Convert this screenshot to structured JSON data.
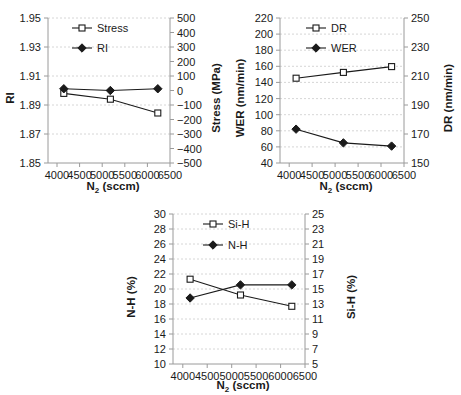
{
  "figure": {
    "background": "#ffffff",
    "line_color": "#1a1a1a",
    "grid_color": "#cccccc",
    "axis_color": "#9a9a9a"
  },
  "chart_data": [
    {
      "id": "panel-a",
      "type": "line",
      "title": "",
      "xlabel": "N2 (sccm)",
      "xlabel_base": "N",
      "xlabel_sub": "2",
      "xlabel_unit": " (sccm)",
      "ylabel": "RI",
      "y2label": "Stress (MPa)",
      "x": [
        4150,
        5180,
        6230
      ],
      "xlim": [
        3800,
        6500
      ],
      "xticks": [
        4000,
        4500,
        5000,
        5500,
        6000,
        6500
      ],
      "ylim": [
        1.85,
        1.95
      ],
      "yticks": [
        1.85,
        1.87,
        1.89,
        1.91,
        1.93,
        1.95
      ],
      "ytick_labels": [
        "1.85",
        "1.87",
        "1.89",
        "1.91",
        "1.93",
        "1.95"
      ],
      "y2lim": [
        -500,
        500
      ],
      "y2ticks": [
        -500,
        -400,
        -300,
        -200,
        -100,
        0,
        100,
        200,
        300,
        400,
        500
      ],
      "y2tick_labels": [
        "−500",
        "−400",
        "−300",
        "−200",
        "−100",
        "0",
        "100",
        "200",
        "300",
        "400",
        "500"
      ],
      "grid": true,
      "legend_position": "top-center",
      "series": [
        {
          "name": "Stress",
          "axis": "right",
          "marker": "open-square",
          "values": [
            -20,
            -60,
            -155
          ],
          "unit": "MPa"
        },
        {
          "name": "RI",
          "axis": "left",
          "marker": "filled-diamond",
          "values": [
            1.9012,
            1.9,
            1.9012
          ],
          "unit": ""
        }
      ]
    },
    {
      "id": "panel-b",
      "type": "line",
      "title": "",
      "xlabel": "N2 (sccm)",
      "xlabel_base": "N",
      "xlabel_sub": "2",
      "xlabel_unit": " (sccm)",
      "ylabel": "WER (nm/min)",
      "y2label": "DR (nm/min)",
      "x": [
        4150,
        5180,
        6230
      ],
      "xlim": [
        3800,
        6500
      ],
      "xticks": [
        4000,
        4500,
        5000,
        5500,
        6000,
        6500
      ],
      "ylim": [
        40,
        220
      ],
      "yticks": [
        40,
        60,
        80,
        100,
        120,
        140,
        160,
        180,
        200,
        220
      ],
      "ytick_labels": [
        "40",
        "60",
        "80",
        "100",
        "120",
        "140",
        "160",
        "180",
        "200",
        "220"
      ],
      "y2lim": [
        150,
        250
      ],
      "y2ticks": [
        150,
        170,
        190,
        210,
        230,
        250
      ],
      "y2tick_labels": [
        "150",
        "170",
        "190",
        "210",
        "230",
        "250"
      ],
      "grid": true,
      "legend_position": "top-center",
      "series": [
        {
          "name": "DR",
          "axis": "right",
          "marker": "open-square",
          "values": [
            208.5,
            212.5,
            216.5
          ],
          "unit": "nm/min"
        },
        {
          "name": "WER",
          "axis": "left",
          "marker": "filled-diamond",
          "values": [
            82,
            65,
            61
          ],
          "unit": "nm/min"
        }
      ]
    },
    {
      "id": "panel-c",
      "type": "line",
      "title": "",
      "xlabel": "N2 (sccm)",
      "xlabel_base": "N",
      "xlabel_sub": "2",
      "xlabel_unit": " (sccm)",
      "ylabel": "N-H (%)",
      "y2label": "Si-H (%)",
      "x": [
        4150,
        5180,
        6230
      ],
      "xlim": [
        3800,
        6500
      ],
      "xticks": [
        4000,
        4500,
        5000,
        5500,
        6000,
        6500
      ],
      "ylim": [
        10,
        30
      ],
      "yticks": [
        10,
        12,
        14,
        16,
        18,
        20,
        22,
        24,
        26,
        28,
        30
      ],
      "ytick_labels": [
        "10",
        "12",
        "14",
        "16",
        "18",
        "20",
        "22",
        "24",
        "26",
        "28",
        "30"
      ],
      "y2lim": [
        5,
        25
      ],
      "y2ticks": [
        5,
        7,
        9,
        11,
        13,
        15,
        17,
        19,
        21,
        23,
        25
      ],
      "y2tick_labels": [
        "5",
        "7",
        "9",
        "11",
        "13",
        "15",
        "17",
        "19",
        "21",
        "23",
        "25"
      ],
      "grid": true,
      "legend_position": "top-center",
      "series": [
        {
          "name": "Si-H",
          "axis": "right",
          "marker": "open-square",
          "values": [
            16.3,
            14.2,
            12.7
          ],
          "unit": "%"
        },
        {
          "name": "N-H",
          "axis": "left",
          "marker": "filled-diamond",
          "values": [
            18.8,
            20.55,
            20.55
          ],
          "unit": "%"
        }
      ]
    }
  ]
}
